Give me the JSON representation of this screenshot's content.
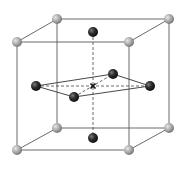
{
  "diagram": {
    "type": "crystal-lattice-unit-cell",
    "colors": {
      "background": "#ffffff",
      "cube_edge": "#555555",
      "dashed_line": "#444444",
      "corner_atom": "#a8a8a8",
      "corner_atom_highlight": "#e0e0e0",
      "face_atom": "#2a2a2a",
      "face_atom_highlight": "#777777",
      "center_marker": "#111111"
    },
    "corner_atoms": [
      {
        "id": "back-top-left",
        "x": 57,
        "y": 19
      },
      {
        "id": "back-top-right",
        "x": 169,
        "y": 19
      },
      {
        "id": "front-top-left",
        "x": 17,
        "y": 42
      },
      {
        "id": "front-top-right",
        "x": 129,
        "y": 42
      },
      {
        "id": "back-bottom-left",
        "x": 57,
        "y": 128
      },
      {
        "id": "back-bottom-right",
        "x": 169,
        "y": 128
      },
      {
        "id": "front-bottom-left",
        "x": 17,
        "y": 150
      },
      {
        "id": "front-bottom-right",
        "x": 129,
        "y": 150
      }
    ],
    "face_atoms": [
      {
        "id": "top",
        "x": 93,
        "y": 32
      },
      {
        "id": "bottom",
        "x": 93,
        "y": 138
      },
      {
        "id": "left",
        "x": 36,
        "y": 86
      },
      {
        "id": "right",
        "x": 150,
        "y": 86
      },
      {
        "id": "back",
        "x": 113,
        "y": 74
      },
      {
        "id": "front",
        "x": 74,
        "y": 97
      }
    ],
    "center_marker": {
      "symbol": "×",
      "x": 93,
      "y": 86
    }
  }
}
